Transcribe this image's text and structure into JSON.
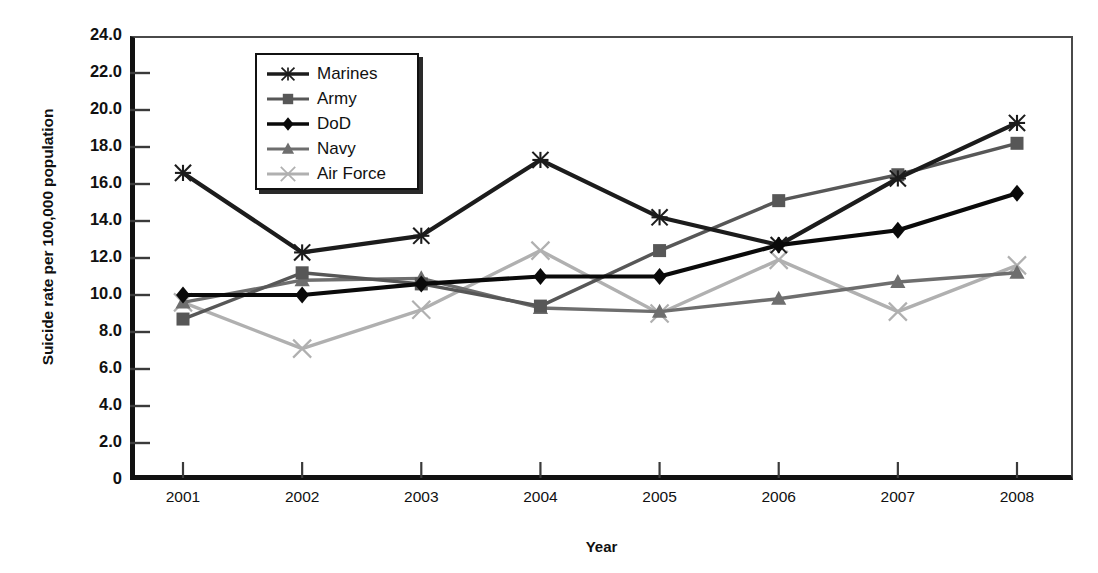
{
  "chart_data": {
    "type": "line",
    "title": "",
    "xlabel": "Year",
    "ylabel": "Suicide rate per 100,000 population",
    "categories": [
      "2001",
      "2002",
      "2003",
      "2004",
      "2005",
      "2006",
      "2007",
      "2008"
    ],
    "x": [
      2001,
      2002,
      2003,
      2004,
      2005,
      2006,
      2007,
      2008
    ],
    "xlim": [
      2000.5,
      2008.7
    ],
    "ylim": [
      0,
      24
    ],
    "yticks": [
      "0",
      "2.0",
      "4.0",
      "6.0",
      "8.0",
      "10.0",
      "12.0",
      "14.0",
      "16.0",
      "18.0",
      "20.0",
      "22.0",
      "24.0"
    ],
    "ytick_values": [
      0,
      2,
      4,
      6,
      8,
      10,
      12,
      14,
      16,
      18,
      20,
      22,
      24
    ],
    "grid": false,
    "legend_position": "upper-left-inside",
    "series": [
      {
        "name": "Marines",
        "marker": "asterisk",
        "color": "#1c1c1c",
        "values": [
          16.6,
          12.3,
          13.2,
          17.3,
          14.2,
          12.7,
          16.3,
          19.3
        ]
      },
      {
        "name": "Army",
        "marker": "square",
        "color": "#575757",
        "values": [
          8.7,
          11.2,
          10.6,
          9.4,
          12.4,
          15.1,
          16.5,
          18.2
        ]
      },
      {
        "name": "DoD",
        "marker": "diamond",
        "color": "#0a0a0a",
        "values": [
          10.0,
          10.0,
          10.6,
          11.0,
          11.0,
          12.7,
          13.5,
          15.5
        ]
      },
      {
        "name": "Navy",
        "marker": "triangle",
        "color": "#6e6e6e",
        "values": [
          9.6,
          10.8,
          10.9,
          9.3,
          9.1,
          9.8,
          10.7,
          11.2
        ]
      },
      {
        "name": "Air Force",
        "marker": "cross",
        "color": "#b0b0b0",
        "values": [
          9.6,
          7.1,
          9.2,
          12.4,
          9.0,
          11.9,
          9.1,
          11.6
        ]
      }
    ]
  },
  "legend": {
    "items": [
      {
        "label": "Marines"
      },
      {
        "label": "Army"
      },
      {
        "label": "DoD"
      },
      {
        "label": "Navy"
      },
      {
        "label": "Air Force"
      }
    ]
  }
}
